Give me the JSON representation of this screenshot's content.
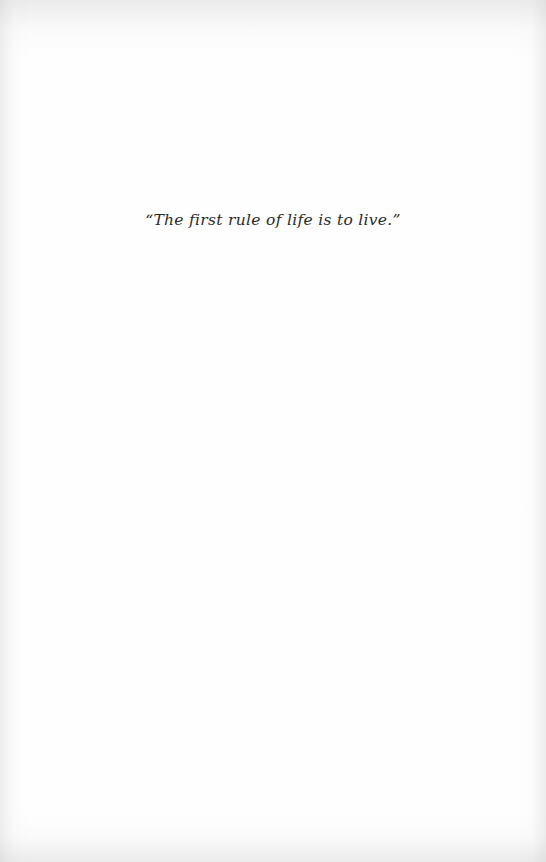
{
  "page": {
    "background_color": "#fefefe",
    "text_color": "#2a2a2a"
  },
  "epigraph": {
    "text": "“The first rule of life is to live.”"
  }
}
